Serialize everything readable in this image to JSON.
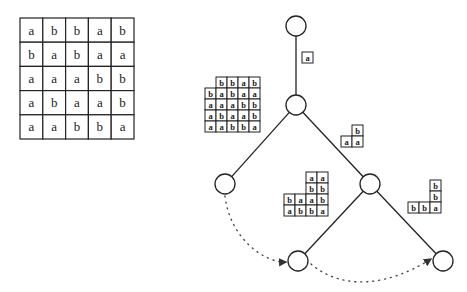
{
  "figure": {
    "big_grid": {
      "x": 20,
      "y": 18,
      "cell_w": 22.8,
      "cell_h": 24.2,
      "rows": [
        [
          "a",
          "b",
          "b",
          "a",
          "b"
        ],
        [
          "b",
          "a",
          "b",
          "a",
          "a"
        ],
        [
          "a",
          "a",
          "a",
          "b",
          "b"
        ],
        [
          "a",
          "b",
          "a",
          "a",
          "b"
        ],
        [
          "a",
          "a",
          "b",
          "b",
          "a"
        ]
      ]
    },
    "tree": {
      "nodes": [
        {
          "id": "root",
          "cx": 296,
          "cy": 26,
          "r": 10
        },
        {
          "id": "n1",
          "cx": 296,
          "cy": 105,
          "r": 10
        },
        {
          "id": "n2",
          "cx": 225,
          "cy": 184,
          "r": 10
        },
        {
          "id": "n3",
          "cx": 370,
          "cy": 184,
          "r": 10
        },
        {
          "id": "n4",
          "cx": 298,
          "cy": 261,
          "r": 10
        },
        {
          "id": "n5",
          "cx": 443,
          "cy": 261,
          "r": 10
        }
      ],
      "edges": [
        {
          "from": "root",
          "to": "n1"
        },
        {
          "from": "n1",
          "to": "n2"
        },
        {
          "from": "n1",
          "to": "n3"
        },
        {
          "from": "n3",
          "to": "n4"
        },
        {
          "from": "n3",
          "to": "n5"
        }
      ],
      "dotted_arrows": [
        {
          "from": "n2",
          "to": "n4"
        },
        {
          "from": "n4",
          "to": "n5"
        }
      ]
    },
    "edge_labels": [
      {
        "name": "label-root-n1",
        "cell": 11,
        "cells": [
          {
            "col": 0,
            "row": 0,
            "x": 302,
            "y": 52,
            "v": "a"
          }
        ]
      },
      {
        "name": "label-n1-n2",
        "cell": 11,
        "cells": [
          {
            "x": 216,
            "y": 77,
            "v": "b"
          },
          {
            "x": 227,
            "y": 77,
            "v": "b"
          },
          {
            "x": 238,
            "y": 77,
            "v": "a"
          },
          {
            "x": 249,
            "y": 77,
            "v": "b"
          },
          {
            "x": 205,
            "y": 88,
            "v": "b"
          },
          {
            "x": 216,
            "y": 88,
            "v": "a"
          },
          {
            "x": 227,
            "y": 88,
            "v": "b"
          },
          {
            "x": 238,
            "y": 88,
            "v": "a"
          },
          {
            "x": 249,
            "y": 88,
            "v": "a"
          },
          {
            "x": 205,
            "y": 99,
            "v": "a"
          },
          {
            "x": 216,
            "y": 99,
            "v": "a"
          },
          {
            "x": 227,
            "y": 99,
            "v": "a"
          },
          {
            "x": 238,
            "y": 99,
            "v": "b"
          },
          {
            "x": 249,
            "y": 99,
            "v": "b"
          },
          {
            "x": 205,
            "y": 110,
            "v": "a"
          },
          {
            "x": 216,
            "y": 110,
            "v": "b"
          },
          {
            "x": 227,
            "y": 110,
            "v": "a"
          },
          {
            "x": 238,
            "y": 110,
            "v": "a"
          },
          {
            "x": 249,
            "y": 110,
            "v": "b"
          },
          {
            "x": 205,
            "y": 121,
            "v": "a"
          },
          {
            "x": 216,
            "y": 121,
            "v": "a"
          },
          {
            "x": 227,
            "y": 121,
            "v": "b"
          },
          {
            "x": 238,
            "y": 121,
            "v": "b"
          },
          {
            "x": 249,
            "y": 121,
            "v": "a"
          }
        ]
      },
      {
        "name": "label-n1-n3",
        "cell": 11,
        "cells": [
          {
            "x": 352,
            "y": 125,
            "v": "b"
          },
          {
            "x": 341,
            "y": 136,
            "v": "a"
          },
          {
            "x": 352,
            "y": 136,
            "v": "a"
          }
        ]
      },
      {
        "name": "label-n3-n4",
        "cell": 11,
        "cells": [
          {
            "x": 306,
            "y": 172,
            "v": "a"
          },
          {
            "x": 317,
            "y": 172,
            "v": "a"
          },
          {
            "x": 306,
            "y": 183,
            "v": "b"
          },
          {
            "x": 317,
            "y": 183,
            "v": "b"
          },
          {
            "x": 284,
            "y": 194,
            "v": "b"
          },
          {
            "x": 295,
            "y": 194,
            "v": "a"
          },
          {
            "x": 306,
            "y": 194,
            "v": "a"
          },
          {
            "x": 317,
            "y": 194,
            "v": "b"
          },
          {
            "x": 284,
            "y": 205,
            "v": "a"
          },
          {
            "x": 295,
            "y": 205,
            "v": "b"
          },
          {
            "x": 306,
            "y": 205,
            "v": "b"
          },
          {
            "x": 317,
            "y": 205,
            "v": "a"
          }
        ]
      },
      {
        "name": "label-n3-n5",
        "cell": 11,
        "cells": [
          {
            "x": 430,
            "y": 180,
            "v": "b"
          },
          {
            "x": 430,
            "y": 191,
            "v": "b"
          },
          {
            "x": 408,
            "y": 202,
            "v": "b"
          },
          {
            "x": 419,
            "y": 202,
            "v": "b"
          },
          {
            "x": 430,
            "y": 202,
            "v": "a"
          }
        ]
      }
    ],
    "colors": {
      "ink": "#222222",
      "background": "#ffffff"
    }
  }
}
